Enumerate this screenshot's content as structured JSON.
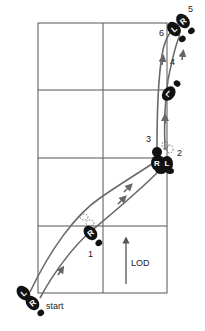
{
  "diagram": {
    "type": "dance footwork floor pattern",
    "grid": {
      "columns": 2,
      "rows": 4,
      "line_color": "#555555"
    },
    "colors": {
      "footprint": "#111111",
      "path": "#666666",
      "footprint_text": "#ffffff"
    },
    "labels": {
      "start": "start",
      "lod": "LOD",
      "step_1": "1",
      "step_2": "2",
      "step_3": "3",
      "step_4": "4",
      "step_5": "5",
      "step_6": "6"
    },
    "footprints": {
      "start_left": "L",
      "start_right": "R",
      "step1_right": "R",
      "step23_right": "R",
      "step23_left": "L",
      "step4_left": "L",
      "step5_right": "R",
      "step6_left": "L"
    }
  }
}
